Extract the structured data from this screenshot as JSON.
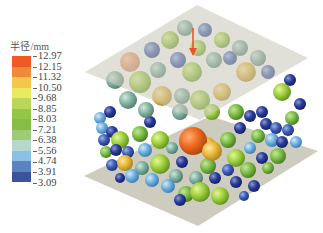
{
  "figure": {
    "load_arrow_color": "#e8552a",
    "plate_color": "#c9c7b8"
  },
  "legend": {
    "title": "半径/mm",
    "ticks": [
      "12.97",
      "12.15",
      "11.32",
      "10.50",
      "9.68",
      "8.85",
      "8.03",
      "7.21",
      "6.38",
      "5.56",
      "4.74",
      "3.91",
      "3.09"
    ],
    "colors": [
      "#ef5a24",
      "#f08a3a",
      "#f4c64a",
      "#eaea62",
      "#b9d85a",
      "#93c748",
      "#86bd47",
      "#9ccc78",
      "#b6d8cc",
      "#8cc0e6",
      "#5b82c1",
      "#3b539b"
    ]
  }
}
